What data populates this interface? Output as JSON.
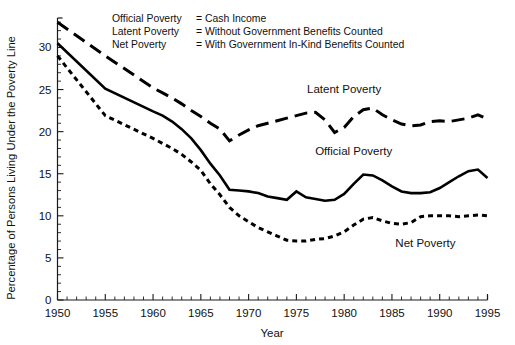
{
  "chart_data": {
    "type": "line",
    "title": "",
    "xlabel": "Year",
    "ylabel": "Percentage of Persons Living Under the Poverty Line",
    "xlim": [
      1950,
      1995
    ],
    "ylim": [
      0,
      33.5
    ],
    "grid": false,
    "legend_position": "top-left-text-block",
    "xticks": [
      1950,
      1955,
      1960,
      1965,
      1970,
      1975,
      1980,
      1985,
      1990,
      1995
    ],
    "xtick_labels": [
      "1950",
      "1955",
      "1960",
      "1965",
      "1970",
      "1975",
      "1980",
      "1985",
      "1990",
      "1995"
    ],
    "x_minor_tick_step": 1,
    "yticks": [
      0,
      5,
      10,
      15,
      20,
      25,
      30
    ],
    "ytick_labels": [
      "0",
      "5",
      "10",
      "15",
      "20",
      "25",
      "30"
    ],
    "y_minor_tick_step": 1,
    "x": [
      1950,
      1955,
      1960,
      1961,
      1962,
      1963,
      1964,
      1965,
      1966,
      1967,
      1968,
      1969,
      1970,
      1971,
      1972,
      1973,
      1974,
      1975,
      1976,
      1977,
      1978,
      1979,
      1980,
      1981,
      1982,
      1983,
      1984,
      1985,
      1986,
      1987,
      1988,
      1989,
      1990,
      1991,
      1992,
      1993,
      1994,
      1995
    ],
    "series": [
      {
        "name": "Latent Poverty",
        "style": "long-dash",
        "color": "#000000",
        "values": [
          33.0,
          29.0,
          25.2,
          24.6,
          24.0,
          23.3,
          22.5,
          21.8,
          21.0,
          20.3,
          18.9,
          19.6,
          20.2,
          20.7,
          21.0,
          21.3,
          21.6,
          21.9,
          22.2,
          22.3,
          21.4,
          19.9,
          20.5,
          21.8,
          22.6,
          22.8,
          22.0,
          21.4,
          20.9,
          20.7,
          20.8,
          21.2,
          21.3,
          21.2,
          21.4,
          21.6,
          22.0,
          21.5
        ]
      },
      {
        "name": "Official Poverty",
        "style": "solid",
        "color": "#000000",
        "values": [
          30.5,
          25.1,
          22.4,
          21.9,
          21.2,
          20.3,
          19.2,
          17.8,
          16.2,
          14.8,
          13.1,
          13.0,
          12.9,
          12.7,
          12.3,
          12.1,
          11.9,
          12.9,
          12.2,
          12.0,
          11.8,
          11.9,
          12.6,
          13.8,
          14.9,
          14.8,
          14.2,
          13.5,
          12.9,
          12.7,
          12.7,
          12.8,
          13.3,
          14.0,
          14.7,
          15.3,
          15.5,
          14.5
        ]
      },
      {
        "name": "Net Poverty",
        "style": "short-dash",
        "color": "#000000",
        "values": [
          29.0,
          21.9,
          19.2,
          18.6,
          18.0,
          17.3,
          16.4,
          15.4,
          13.8,
          12.5,
          11.0,
          10.0,
          9.3,
          8.6,
          8.1,
          7.6,
          7.1,
          7.0,
          7.0,
          7.2,
          7.3,
          7.6,
          8.1,
          8.9,
          9.6,
          9.8,
          9.4,
          9.1,
          9.0,
          9.2,
          9.9,
          10.0,
          10.0,
          10.0,
          9.9,
          10.0,
          10.1,
          10.0
        ]
      }
    ],
    "annotations": [
      {
        "text": "Latent Poverty",
        "x": 1980.0,
        "y": 24.6
      },
      {
        "text": "Official Poverty",
        "x": 1981.0,
        "y": 17.2
      },
      {
        "text": "Net Poverty",
        "x": 1988.5,
        "y": 6.3
      }
    ]
  },
  "legend": {
    "rows": [
      {
        "term": "Official Poverty",
        "eq": "=",
        "definition": "Cash Income"
      },
      {
        "term": "Latent Poverty",
        "eq": "=",
        "definition": "Without Government Benefits Counted"
      },
      {
        "term": "Net Poverty",
        "eq": "=",
        "definition": "With Government In-Kind Benefits Counted"
      }
    ]
  },
  "colors": {
    "ink": "#000000",
    "background": "#ffffff"
  }
}
